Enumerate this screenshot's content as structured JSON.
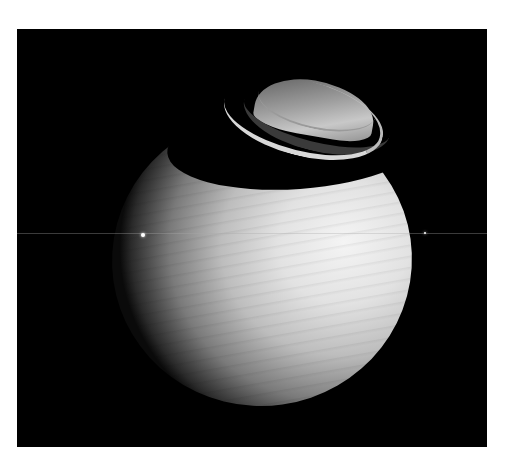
{
  "image": {
    "subject": "Saturn with rings seen at a low angle, ring shadow across northern hemisphere",
    "background_color": "#000000",
    "page_color": "#ffffff",
    "frame": {
      "x": 17,
      "y": 29,
      "width": 470,
      "height": 418
    },
    "features": [
      {
        "name": "planet-body",
        "color": "#e6e6e6"
      },
      {
        "name": "ring-system",
        "color": "#d0d0d0"
      },
      {
        "name": "ring-shadow",
        "color": "#000000"
      },
      {
        "name": "moon-left",
        "x": 143,
        "y": 235
      },
      {
        "name": "moon-right",
        "x": 425,
        "y": 233
      },
      {
        "name": "ring-plane-line",
        "y": 233
      }
    ]
  }
}
